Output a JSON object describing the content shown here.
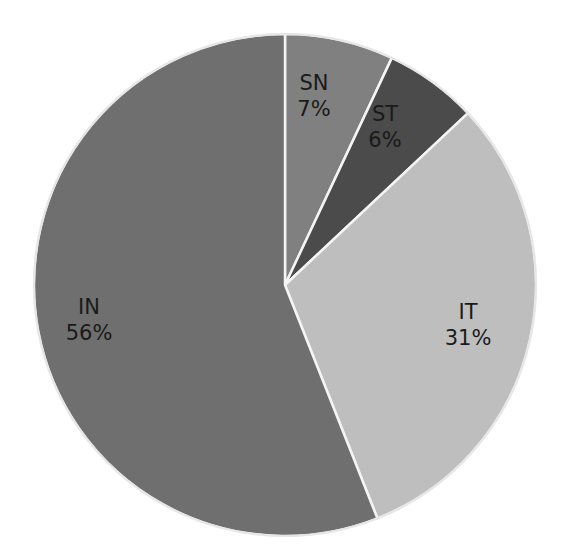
{
  "chart_data": {
    "type": "pie",
    "title": "",
    "categories": [
      "SN",
      "ST",
      "IT",
      "IN"
    ],
    "values": [
      7,
      6,
      31,
      56
    ],
    "unit": "%",
    "colors": [
      "#808080",
      "#4b4b4b",
      "#bebebe",
      "#6f6f6f"
    ],
    "start_angle_deg": 0,
    "direction": "clockwise",
    "legend": "none",
    "data_labels": "category and percentage inside slices"
  },
  "labels": [
    {
      "name": "SN",
      "pct": "7%",
      "x": 314,
      "y": 96
    },
    {
      "name": "ST",
      "pct": "6%",
      "x": 385,
      "y": 127
    },
    {
      "name": "IT",
      "pct": "31%",
      "x": 468,
      "y": 325
    },
    {
      "name": "IN",
      "pct": "56%",
      "x": 89,
      "y": 320
    }
  ],
  "geometry": {
    "cx": 285,
    "cy": 285,
    "r": 251
  }
}
